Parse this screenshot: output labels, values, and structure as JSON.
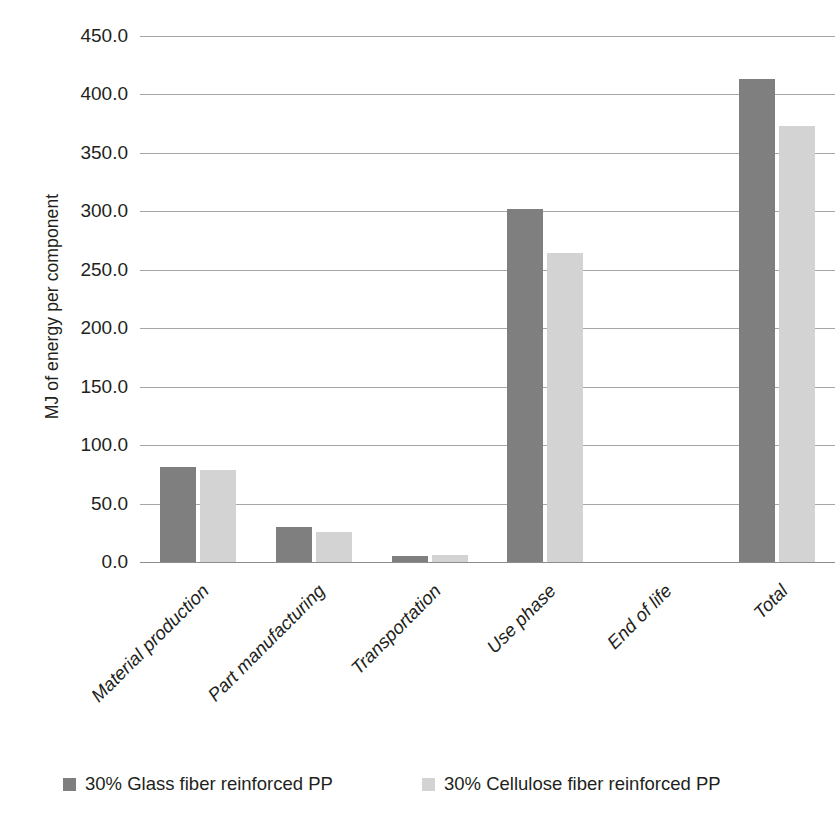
{
  "chart_data": {
    "type": "bar",
    "title": "",
    "xlabel": "",
    "ylabel": "MJ of energy per component",
    "ylim": [
      0,
      450
    ],
    "ytick_step": 50,
    "ytick_labels": [
      "0.0",
      "50.0",
      "100.0",
      "150.0",
      "200.0",
      "250.0",
      "300.0",
      "350.0",
      "400.0",
      "450.0"
    ],
    "grid": true,
    "legend_position": "bottom",
    "categories": [
      "Material production",
      "Part manufacturing",
      "Transportation",
      "Use phase",
      "End of life",
      "Total"
    ],
    "series": [
      {
        "name": "30% Glass fiber reinforced PP",
        "color": "#7f7f7f",
        "values": [
          81,
          30,
          5,
          302,
          0,
          413
        ]
      },
      {
        "name": "30% Cellulose fiber reinforced PP",
        "color": "#d3d3d3",
        "values": [
          79,
          26,
          6,
          264,
          0,
          373
        ]
      }
    ]
  },
  "legend": {
    "items": [
      {
        "label": "30% Glass fiber reinforced PP",
        "color": "#7f7f7f"
      },
      {
        "label": "30% Cellulose fiber reinforced PP",
        "color": "#d3d3d3"
      }
    ]
  },
  "colors": {
    "background": "#ffffff",
    "gridline": "#a6a6a6",
    "axis": "#8c8c8c",
    "text": "#231f20",
    "series_0": "#7f7f7f",
    "series_1": "#d3d3d3"
  }
}
